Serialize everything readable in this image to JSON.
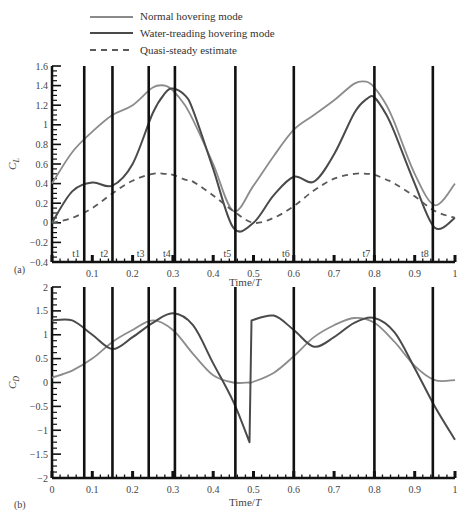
{
  "legend": {
    "items": [
      {
        "label": "Normal hovering mode",
        "style": "solid",
        "color": "#8a8a8a"
      },
      {
        "label": "Water-treading hovering mode",
        "style": "solid",
        "color": "#4a4a4a"
      },
      {
        "label": "Quasi-steady estimate",
        "style": "dashed",
        "color": "#5a5a5a"
      }
    ]
  },
  "panel_labels": {
    "a": "(a)",
    "b": "(b)"
  },
  "caption_partial": "Figure 4.1x ...",
  "chart_data": [
    {
      "type": "line",
      "panel": "(a)",
      "title": "",
      "xlabel": "Time/T",
      "ylabel": "C_L",
      "xlim": [
        0,
        1
      ],
      "ylim": [
        -0.4,
        1.6
      ],
      "yticks": [
        -0.4,
        -0.2,
        0,
        0.2,
        0.4,
        0.6,
        0.8,
        1,
        1.2,
        1.4,
        1.6
      ],
      "xticks": [
        0.1,
        0.2,
        0.3,
        0.4,
        0.5,
        0.6,
        0.7,
        0.8,
        0.9,
        1
      ],
      "grid": false,
      "legend_position": "top",
      "time_markers": [
        {
          "label": "t1",
          "x": 0.08
        },
        {
          "label": "t2",
          "x": 0.15
        },
        {
          "label": "t3",
          "x": 0.24
        },
        {
          "label": "t4",
          "x": 0.305
        },
        {
          "label": "t5",
          "x": 0.455
        },
        {
          "label": "t6",
          "x": 0.6
        },
        {
          "label": "t7",
          "x": 0.8
        },
        {
          "label": "t8",
          "x": 0.945
        }
      ],
      "x": [
        0,
        0.05,
        0.1,
        0.15,
        0.2,
        0.25,
        0.28,
        0.3,
        0.33,
        0.35,
        0.4,
        0.45,
        0.5,
        0.55,
        0.6,
        0.65,
        0.7,
        0.75,
        0.78,
        0.8,
        0.83,
        0.85,
        0.9,
        0.95,
        1.0
      ],
      "series": [
        {
          "name": "Normal hovering mode",
          "values": [
            0.4,
            0.72,
            0.93,
            1.1,
            1.2,
            1.38,
            1.4,
            1.35,
            1.2,
            1.05,
            0.6,
            0.12,
            0.38,
            0.68,
            0.95,
            1.1,
            1.25,
            1.42,
            1.44,
            1.38,
            1.2,
            1.02,
            0.5,
            0.18,
            0.4
          ]
        },
        {
          "name": "Water-treading hovering mode",
          "values": [
            0.0,
            0.32,
            0.41,
            0.38,
            0.6,
            1.12,
            1.32,
            1.37,
            1.3,
            1.15,
            0.55,
            -0.05,
            0.0,
            0.28,
            0.47,
            0.42,
            0.7,
            1.12,
            1.26,
            1.28,
            1.1,
            0.92,
            0.4,
            -0.05,
            0.05
          ]
        },
        {
          "name": "Quasi-steady estimate",
          "values": [
            0.0,
            0.05,
            0.15,
            0.3,
            0.43,
            0.5,
            0.5,
            0.49,
            0.44,
            0.42,
            0.28,
            0.12,
            0.0,
            0.05,
            0.17,
            0.33,
            0.45,
            0.5,
            0.5,
            0.49,
            0.44,
            0.4,
            0.27,
            0.12,
            0.05
          ]
        }
      ]
    },
    {
      "type": "line",
      "panel": "(b)",
      "title": "",
      "xlabel": "Time/T",
      "ylabel": "C_D",
      "xlim": [
        0,
        1
      ],
      "ylim": [
        -2,
        2
      ],
      "yticks": [
        -2,
        -1.5,
        -1,
        -0.5,
        0,
        0.5,
        1,
        1.5,
        2
      ],
      "xticks": [
        0,
        0.1,
        0.2,
        0.3,
        0.4,
        0.5,
        0.6,
        0.7,
        0.8,
        0.9,
        1
      ],
      "grid": false,
      "time_markers_x": [
        0.08,
        0.15,
        0.24,
        0.305,
        0.455,
        0.6,
        0.8,
        0.945
      ],
      "x": [
        0,
        0.05,
        0.1,
        0.15,
        0.2,
        0.25,
        0.3,
        0.35,
        0.4,
        0.45,
        0.49,
        0.495,
        0.55,
        0.6,
        0.65,
        0.7,
        0.75,
        0.8,
        0.85,
        0.9,
        0.95,
        1.0
      ],
      "series": [
        {
          "name": "Normal hovering mode",
          "values": [
            0.1,
            0.25,
            0.5,
            0.85,
            1.1,
            1.3,
            1.1,
            0.6,
            0.15,
            0.0,
            0.0,
            0.0,
            0.2,
            0.55,
            0.95,
            1.2,
            1.35,
            1.25,
            0.85,
            0.35,
            0.05,
            0.05
          ]
        },
        {
          "name": "Water-treading hovering mode",
          "values": [
            1.3,
            1.3,
            1.0,
            0.7,
            0.95,
            1.25,
            1.45,
            1.2,
            0.4,
            -0.4,
            -1.25,
            1.3,
            1.4,
            1.1,
            0.75,
            0.95,
            1.25,
            1.35,
            1.05,
            0.3,
            -0.5,
            -1.2
          ]
        }
      ]
    }
  ]
}
